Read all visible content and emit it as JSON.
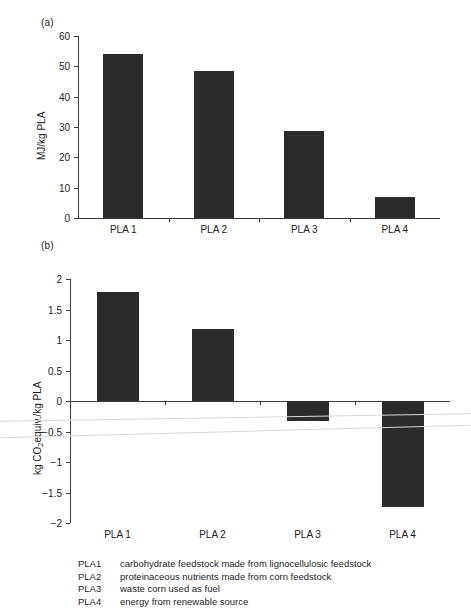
{
  "figure": {
    "panel_a_label": "(a)",
    "panel_b_label": "(b)"
  },
  "legend": {
    "rows": [
      {
        "key": "PLA1",
        "desc": "carbohydrate feedstock made from lignocellulosic feedstock"
      },
      {
        "key": "PLA2",
        "desc": "proteinaceous nutrients made from corn feedstock"
      },
      {
        "key": "PLA3",
        "desc": "waste corn used as fuel"
      },
      {
        "key": "PLA4",
        "desc": "energy from renewable source"
      }
    ]
  },
  "chart_data": [
    {
      "id": "panel-a",
      "type": "bar",
      "title": "(a)",
      "xlabel": "",
      "ylabel": "MJ/kg PLA",
      "categories": [
        "PLA 1",
        "PLA 2",
        "PLA 3",
        "PLA 4"
      ],
      "values": [
        54.0,
        48.4,
        28.7,
        6.8
      ],
      "ylim": [
        0,
        60
      ],
      "yticks": [
        0,
        10,
        20,
        30,
        40,
        50,
        60
      ],
      "ytick_labels": [
        "0",
        "10",
        "20",
        "30",
        "40",
        "50",
        "60"
      ],
      "grid": false,
      "legend_position": "none",
      "bar_color": "#2b2b2b"
    },
    {
      "id": "panel-b",
      "type": "bar",
      "title": "(b)",
      "xlabel": "",
      "ylabel": "kg CO2equiv./kg PLA",
      "categories": [
        "PLA 1",
        "PLA 2",
        "PLA 3",
        "PLA 4"
      ],
      "values": [
        1.79,
        1.18,
        -0.33,
        -1.73
      ],
      "ylim": [
        -2,
        2
      ],
      "yticks": [
        -2,
        -1.5,
        -1,
        -0.5,
        0,
        0.5,
        1,
        1.5,
        2
      ],
      "ytick_labels": [
        "−2",
        "−1.5",
        "−1",
        "−0.5",
        "0",
        "0.5",
        "1",
        "1.5",
        "2"
      ],
      "grid": false,
      "legend_position": "none",
      "bar_color": "#2b2b2b"
    }
  ]
}
